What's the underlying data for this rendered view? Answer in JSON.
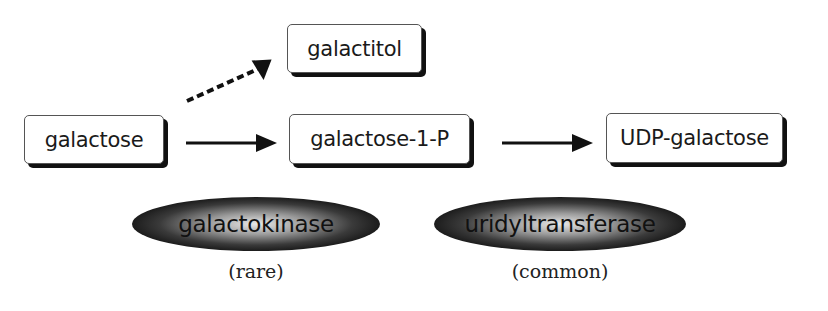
{
  "nodes": {
    "galactose": "galactose",
    "galactitol": "galactitol",
    "galactose_1_p": "galactose-1-P",
    "udp_galactose": "UDP-galactose"
  },
  "enzymes": [
    {
      "label": "galactokinase",
      "frequency": "(rare)"
    },
    {
      "label": "uridyltransferase",
      "frequency": "(common)"
    }
  ],
  "edges": [
    {
      "from": "galactose",
      "to": "galactitol",
      "style": "dashed"
    },
    {
      "from": "galactose",
      "to": "galactose-1-P",
      "style": "solid"
    },
    {
      "from": "galactose-1-P",
      "to": "UDP-galactose",
      "style": "solid"
    }
  ]
}
